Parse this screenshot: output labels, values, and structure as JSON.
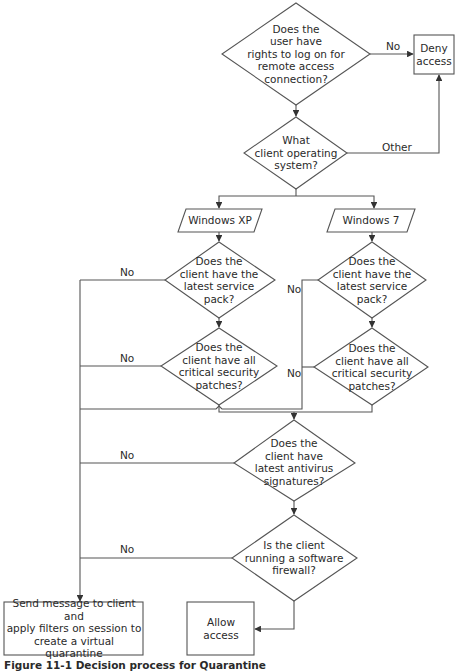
{
  "diagram": {
    "nodes": {
      "q_rights": "Does the\nuser have\nrights to log on for\nremote access\nconnection?",
      "deny": "Deny\naccess",
      "q_os": "What\nclient operating\nsystem?",
      "os_xp": "Windows XP",
      "os_7": "Windows 7",
      "xp_q_sp": "Does the\nclient have the\nlatest service\npack?",
      "xp_q_patches": "Does the\nclient have all\ncritical security\npatches?",
      "w7_q_sp": "Does the\nclient have the\nlatest service\npack?",
      "w7_q_patches": "Does the\nclient have all\ncritical security\npatches?",
      "q_antivirus": "Does the\nclient have\nlatest antivirus\nsignatures?",
      "q_firewall": "Is the client\nrunning a software\nfirewall?",
      "quarantine": "Send message to client and\napply filters on session to\ncreate a virtual quarantine",
      "allow": "Allow\naccess"
    },
    "edge_labels": {
      "rights_no": "No",
      "os_other": "Other",
      "xp_sp_no": "No",
      "xp_patches_no": "No",
      "w7_sp_no": "No",
      "w7_patches_no": "No",
      "antivirus_no": "No",
      "firewall_no": "No"
    },
    "caption": "Figure 11-1  Decision process for Quarantine"
  },
  "colors": {
    "stroke": "#555555",
    "text": "#2a2a2a",
    "background": "#ffffff"
  }
}
